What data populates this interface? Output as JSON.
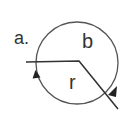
{
  "diagram": {
    "panel_label": "a.",
    "region_labels": {
      "upper": "b",
      "lower": "r"
    },
    "colors": {
      "stroke": "#333333",
      "circle": "#555555",
      "background": "#ffffff"
    },
    "elements": [
      {
        "type": "circle",
        "name": "loop"
      },
      {
        "type": "polyline",
        "name": "angled-line"
      },
      {
        "type": "arrow",
        "name": "left-arrowhead",
        "direction": "up"
      },
      {
        "type": "arrow",
        "name": "right-arrowhead",
        "direction": "down"
      }
    ]
  }
}
